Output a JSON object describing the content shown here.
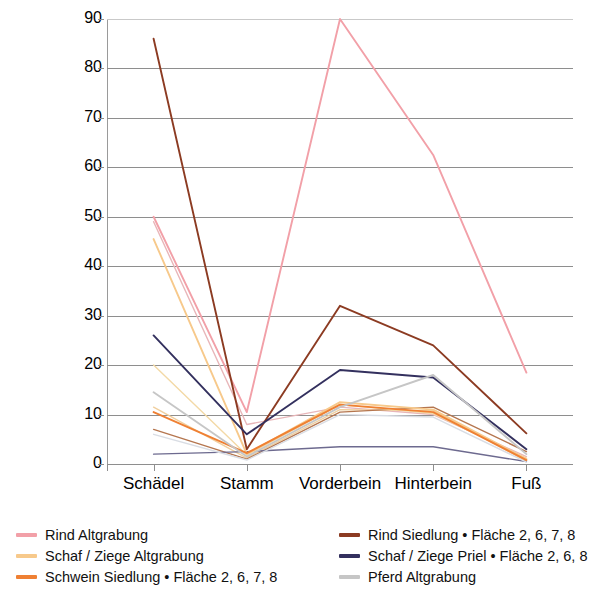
{
  "chart_data": {
    "type": "line",
    "title": "",
    "xlabel": "",
    "ylabel": "Knochenzahl / Zahl der Skelettelemente pro Körperregion",
    "ylabel_line1": "Knochenzahl / Zahl der Skelett-",
    "ylabel_line2": "elemente pro Körperregion",
    "categories": [
      "Schädel",
      "Stamm",
      "Vorderbein",
      "Hinterbein",
      "Fuß"
    ],
    "ylim": [
      0,
      90
    ],
    "yticks": [
      0,
      10,
      20,
      30,
      40,
      50,
      60,
      70,
      80,
      90
    ],
    "grid": true,
    "legend_position": "bottom",
    "series": [
      {
        "name": "Rind Altgrabung",
        "color": "#f2a0a8",
        "values": [
          50.0,
          10.5,
          90.0,
          62.5,
          18.5
        ]
      },
      {
        "name": "Schaf / Ziege Altgrabung",
        "color": "#f7c98b",
        "values": [
          45.5,
          2.0,
          12.5,
          11.0,
          1.0
        ]
      },
      {
        "name": "Schwein Siedlung • Fläche 2, 6, 7, 8",
        "color": "#ef8033",
        "values": [
          10.5,
          2.2,
          12.0,
          10.5,
          0.8
        ]
      },
      {
        "name": "Rind Siedlung • Fläche 2, 6, 7, 8",
        "color": "#8c3b22",
        "values": [
          86.0,
          3.0,
          32.0,
          24.0,
          6.2
        ]
      },
      {
        "name": "Schaf / Ziege Priel • Fläche 2, 6, 8",
        "color": "#33305e",
        "values": [
          26.0,
          6.0,
          19.0,
          17.5,
          3.0
        ]
      },
      {
        "name": "Pferd Altgrabung",
        "color": "#c6c6c6",
        "values": [
          14.5,
          1.5,
          11.5,
          18.0,
          2.0
        ]
      }
    ],
    "extra_series": [
      {
        "name": "series-7",
        "color": "#e8b6b9",
        "values": [
          49.0,
          8.0,
          11.5,
          10.0,
          1.5
        ]
      },
      {
        "name": "series-8",
        "color": "#f0cf9e",
        "values": [
          11.5,
          1.2,
          11.0,
          10.8,
          0.6
        ]
      },
      {
        "name": "series-9",
        "color": "#b5764f",
        "values": [
          7.0,
          1.0,
          10.5,
          11.5,
          2.5
        ]
      },
      {
        "name": "series-10",
        "color": "#6d6a8f",
        "values": [
          2.0,
          2.5,
          3.5,
          3.5,
          0.5
        ]
      },
      {
        "name": "series-11",
        "color": "#d9dde4",
        "values": [
          6.0,
          0.8,
          10.0,
          9.5,
          0.4
        ]
      },
      {
        "name": "series-12",
        "color": "#f3d9a6",
        "values": [
          20.0,
          1.8,
          12.0,
          10.2,
          1.2
        ]
      }
    ]
  },
  "legend": {
    "left": [
      {
        "label": "Rind Altgrabung",
        "color": "#f2a0a8",
        "icon": "line-swatch"
      },
      {
        "label": "Schaf / Ziege Altgrabung",
        "color": "#f7c98b",
        "icon": "line-swatch"
      },
      {
        "label": "Schwein Siedlung • Fläche 2, 6, 7, 8",
        "color": "#ef8033",
        "icon": "line-swatch"
      }
    ],
    "right": [
      {
        "label": "Rind Siedlung • Fläche 2, 6, 7, 8",
        "color": "#8c3b22",
        "icon": "line-swatch"
      },
      {
        "label": "Schaf / Ziege Priel • Fläche 2, 6, 8",
        "color": "#33305e",
        "icon": "line-swatch"
      },
      {
        "label": "Pferd Altgrabung",
        "color": "#c6c6c6",
        "icon": "line-swatch"
      }
    ]
  }
}
